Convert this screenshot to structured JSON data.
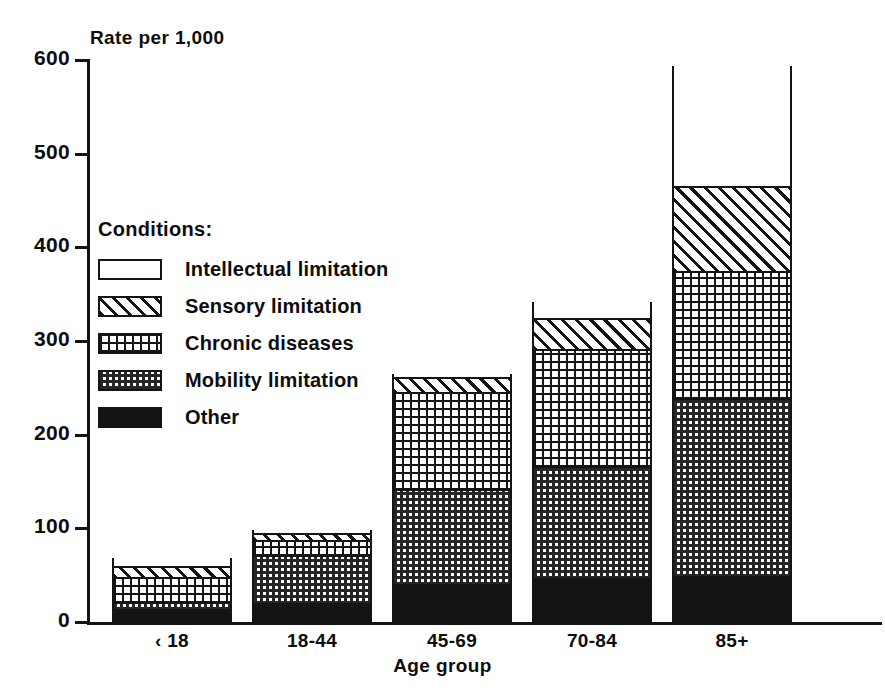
{
  "chart_data": {
    "type": "bar",
    "subtype": "stacked",
    "title": "",
    "ylabel": "Rate per 1,000",
    "xlabel": "Age group",
    "categories": [
      "‹ 18",
      "18-44",
      "45-69",
      "70-84",
      "85+"
    ],
    "ylim": [
      0,
      600
    ],
    "yticks": [
      0,
      100,
      200,
      300,
      400,
      500,
      600
    ],
    "ytick_labels": [
      "0",
      "100",
      "200",
      "300",
      "400",
      "500",
      "600"
    ],
    "grid": false,
    "legend_position": "inside-upper-left",
    "legend_title": "Conditions:",
    "series": [
      {
        "name": "Other",
        "key": "other",
        "pattern": "solid-black",
        "values": [
          13,
          19,
          40,
          46,
          48
        ]
      },
      {
        "name": "Mobility limitation",
        "key": "mobility",
        "pattern": "dense-dots",
        "values": [
          7,
          51,
          101,
          119,
          190
        ]
      },
      {
        "name": "Chronic diseases",
        "key": "chronic",
        "pattern": "open-grid-dots",
        "values": [
          27,
          17,
          103,
          125,
          136
        ]
      },
      {
        "name": "Sensory limitation",
        "key": "sensory",
        "pattern": "diagonal-hatch",
        "values": [
          12,
          7,
          16,
          34,
          90
        ]
      },
      {
        "name": "Intellectual limitation",
        "key": "intellectual",
        "pattern": "empty-white",
        "values": [
          9,
          4,
          5,
          18,
          130
        ]
      }
    ],
    "totals": [
      68,
      98,
      265,
      342,
      594
    ],
    "annotations": []
  },
  "legend": {
    "title": "Conditions:",
    "items": [
      {
        "label": "Intellectual limitation",
        "key": "intellectual"
      },
      {
        "label": "Sensory limitation",
        "key": "sensory"
      },
      {
        "label": "Chronic diseases",
        "key": "chronic"
      },
      {
        "label": "Mobility limitation",
        "key": "mobility"
      },
      {
        "label": "Other",
        "key": "other"
      }
    ]
  },
  "axes": {
    "y_title": "Rate per 1,000",
    "x_title": "Age group",
    "y_labels": [
      "600",
      "500",
      "400",
      "300",
      "200",
      "100",
      "0"
    ],
    "x_labels": [
      "‹ 18",
      "18-44",
      "45-69",
      "70-84",
      "85+"
    ]
  },
  "colors": {
    "ink": "#141414",
    "paper": "#ffffff",
    "pattern_gray": "#262626"
  }
}
